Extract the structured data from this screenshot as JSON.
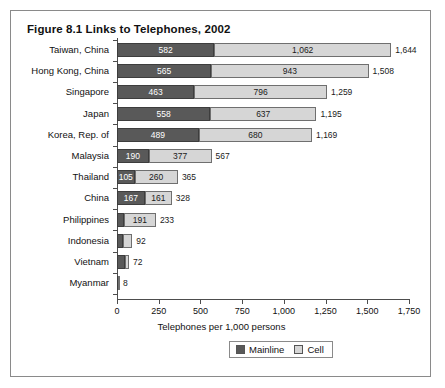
{
  "figure": {
    "title": "Figure 8.1 Links to Telephones, 2002"
  },
  "legend": {
    "mainline_label": "Mainline",
    "cell_label": "Cell",
    "mainline_color": "#595959",
    "cell_color": "#d6d6d6"
  },
  "chart_data": {
    "type": "bar",
    "orientation": "horizontal",
    "stacked": true,
    "title": "Figure 8.1 Links to Telephones, 2002",
    "xlabel": "Telephones per 1,000 persons",
    "ylabel": "",
    "xlim": [
      0,
      1750
    ],
    "xticks": [
      0,
      250,
      500,
      750,
      1000,
      1250,
      1500,
      1750
    ],
    "xtick_labels": [
      "0",
      "250",
      "500",
      "750",
      "1,000",
      "1,250",
      "1,500",
      "1,750"
    ],
    "grid": false,
    "legend_position": "bottom",
    "categories": [
      "Taiwan, China",
      "Hong Kong, China",
      "Singapore",
      "Japan",
      "Korea, Rep. of",
      "Malaysia",
      "Thailand",
      "China",
      "Philippines",
      "Indonesia",
      "Vietnam",
      "Myanmar"
    ],
    "series": [
      {
        "name": "Mainline",
        "color": "#595959",
        "values": [
          582,
          565,
          463,
          558,
          489,
          190,
          105,
          167,
          42,
          37,
          48,
          6
        ]
      },
      {
        "name": "Cell",
        "color": "#d6d6d6",
        "values": [
          1062,
          943,
          796,
          637,
          680,
          377,
          260,
          161,
          191,
          55,
          24,
          2
        ]
      }
    ],
    "totals": [
      1644,
      1508,
      1259,
      1195,
      1169,
      567,
      365,
      328,
      233,
      92,
      72,
      8
    ],
    "total_labels": [
      "1,644",
      "1,508",
      "1,259",
      "1,195",
      "1,169",
      "567",
      "365",
      "328",
      "233",
      "92",
      "72",
      "8"
    ],
    "rows": [
      {
        "category": "Taiwan, China",
        "mainline": 582,
        "mainline_label": "582",
        "cell": 1062,
        "cell_label": "1,062",
        "total": 1644,
        "total_label": "1,644"
      },
      {
        "category": "Hong Kong, China",
        "mainline": 565,
        "mainline_label": "565",
        "cell": 943,
        "cell_label": "943",
        "total": 1508,
        "total_label": "1,508"
      },
      {
        "category": "Singapore",
        "mainline": 463,
        "mainline_label": "463",
        "cell": 796,
        "cell_label": "796",
        "total": 1259,
        "total_label": "1,259"
      },
      {
        "category": "Japan",
        "mainline": 558,
        "mainline_label": "558",
        "cell": 637,
        "cell_label": "637",
        "total": 1195,
        "total_label": "1,195"
      },
      {
        "category": "Korea, Rep. of",
        "mainline": 489,
        "mainline_label": "489",
        "cell": 680,
        "cell_label": "680",
        "total": 1169,
        "total_label": "1,169"
      },
      {
        "category": "Malaysia",
        "mainline": 190,
        "mainline_label": "190",
        "cell": 377,
        "cell_label": "377",
        "total": 567,
        "total_label": "567"
      },
      {
        "category": "Thailand",
        "mainline": 105,
        "mainline_label": "105",
        "cell": 260,
        "cell_label": "260",
        "total": 365,
        "total_label": "365"
      },
      {
        "category": "China",
        "mainline": 167,
        "mainline_label": "167",
        "cell": 161,
        "cell_label": "161",
        "total": 328,
        "total_label": "328"
      },
      {
        "category": "Philippines",
        "mainline": 42,
        "mainline_label": "",
        "cell": 191,
        "cell_label": "191",
        "total": 233,
        "total_label": "233"
      },
      {
        "category": "Indonesia",
        "mainline": 37,
        "mainline_label": "",
        "cell": 55,
        "cell_label": "",
        "total": 92,
        "total_label": "92"
      },
      {
        "category": "Vietnam",
        "mainline": 48,
        "mainline_label": "",
        "cell": 24,
        "cell_label": "",
        "total": 72,
        "total_label": "72"
      },
      {
        "category": "Myanmar",
        "mainline": 6,
        "mainline_label": "",
        "cell": 2,
        "cell_label": "",
        "total": 8,
        "total_label": "8"
      }
    ]
  }
}
